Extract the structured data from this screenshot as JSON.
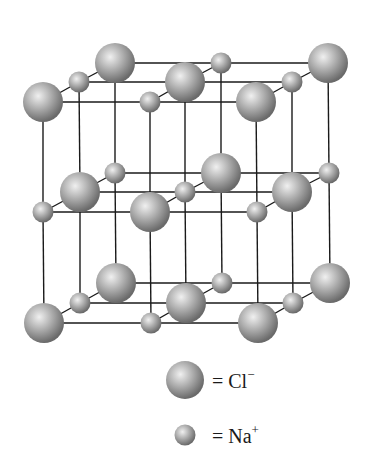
{
  "diagram": {
    "colors": {
      "line": "#1a1a1a",
      "sphere_light": "#e6e6e6",
      "sphere_mid": "#a8a8a8",
      "sphere_dark": "#6e6e6e"
    },
    "radii": {
      "large": 20,
      "small": 10.5
    },
    "layers": [
      {
        "name": "top",
        "atoms": [
          {
            "x": 115,
            "y": 63,
            "type": "large"
          },
          {
            "x": 221,
            "y": 63,
            "type": "small"
          },
          {
            "x": 328,
            "y": 63,
            "type": "large"
          },
          {
            "x": 79,
            "y": 82,
            "type": "small"
          },
          {
            "x": 185,
            "y": 82,
            "type": "large"
          },
          {
            "x": 292,
            "y": 82,
            "type": "small"
          },
          {
            "x": 43,
            "y": 102,
            "type": "large"
          },
          {
            "x": 150,
            "y": 102,
            "type": "small"
          },
          {
            "x": 256,
            "y": 102,
            "type": "large"
          }
        ]
      },
      {
        "name": "middle",
        "atoms": [
          {
            "x": 115,
            "y": 173,
            "type": "small"
          },
          {
            "x": 221,
            "y": 173,
            "type": "large"
          },
          {
            "x": 329,
            "y": 173,
            "type": "small"
          },
          {
            "x": 80,
            "y": 192,
            "type": "large"
          },
          {
            "x": 185,
            "y": 192,
            "type": "small"
          },
          {
            "x": 292,
            "y": 192,
            "type": "large"
          },
          {
            "x": 43,
            "y": 212,
            "type": "small"
          },
          {
            "x": 150,
            "y": 212,
            "type": "large"
          },
          {
            "x": 257,
            "y": 212,
            "type": "small"
          }
        ]
      },
      {
        "name": "bottom",
        "atoms": [
          {
            "x": 116,
            "y": 283,
            "type": "large"
          },
          {
            "x": 222,
            "y": 283,
            "type": "small"
          },
          {
            "x": 330,
            "y": 283,
            "type": "large"
          },
          {
            "x": 80,
            "y": 303,
            "type": "small"
          },
          {
            "x": 186,
            "y": 303,
            "type": "large"
          },
          {
            "x": 293,
            "y": 303,
            "type": "small"
          },
          {
            "x": 44,
            "y": 323,
            "type": "large"
          },
          {
            "x": 151,
            "y": 323,
            "type": "small"
          },
          {
            "x": 258,
            "y": 323,
            "type": "large"
          }
        ]
      }
    ]
  },
  "legend": {
    "items": [
      {
        "symbol": "large",
        "label": "= Cl",
        "charge": "−"
      },
      {
        "symbol": "small",
        "label": "= Na",
        "charge": "+"
      }
    ]
  }
}
